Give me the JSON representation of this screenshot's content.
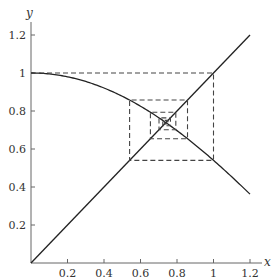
{
  "chart_data": {
    "type": "line",
    "title": "",
    "xlabel": "x",
    "ylabel": "y",
    "xlim": [
      0,
      1.25
    ],
    "ylim": [
      0,
      1.28
    ],
    "x_ticks": [
      "0.2",
      "0.4",
      "0.6",
      "0.8",
      "1",
      "1.2"
    ],
    "y_ticks": [
      "0.2",
      "0.4",
      "0.6",
      "0.8",
      "1",
      "1.2"
    ],
    "grid": false,
    "legend": null,
    "series": [
      {
        "name": "y = cos(x)",
        "style": "solid",
        "x": [
          0,
          0.1,
          0.2,
          0.3,
          0.4,
          0.5,
          0.6,
          0.7,
          0.8,
          0.9,
          1.0,
          1.1,
          1.2
        ],
        "y": [
          1,
          0.995,
          0.98,
          0.955,
          0.921,
          0.878,
          0.825,
          0.765,
          0.697,
          0.622,
          0.54,
          0.454,
          0.362
        ]
      },
      {
        "name": "y = x",
        "style": "solid",
        "x": [
          0,
          1.2
        ],
        "y": [
          0,
          1.2
        ]
      },
      {
        "name": "cobweb iteration",
        "style": "dashed",
        "points": [
          [
            0,
            1
          ],
          [
            1,
            1
          ],
          [
            1,
            0.5403
          ],
          [
            0.5403,
            0.5403
          ],
          [
            0.5403,
            0.8576
          ],
          [
            0.8576,
            0.8576
          ],
          [
            0.8576,
            0.6543
          ],
          [
            0.6543,
            0.6543
          ],
          [
            0.6543,
            0.7935
          ],
          [
            0.7935,
            0.7935
          ],
          [
            0.7935,
            0.7014
          ],
          [
            0.7014,
            0.7014
          ],
          [
            0.7014,
            0.764
          ],
          [
            0.764,
            0.764
          ],
          [
            0.764,
            0.7221
          ],
          [
            0.7221,
            0.7221
          ],
          [
            0.7221,
            0.7504
          ],
          [
            0.7504,
            0.7504
          ],
          [
            0.7504,
            0.7314
          ],
          [
            0.7314,
            0.7314
          ],
          [
            0.7314,
            0.7442
          ],
          [
            0.7442,
            0.7442
          ],
          [
            0.7442,
            0.7356
          ],
          [
            0.7356,
            0.7356
          ]
        ]
      }
    ],
    "fixed_point": [
      0.739,
      0.739
    ]
  }
}
